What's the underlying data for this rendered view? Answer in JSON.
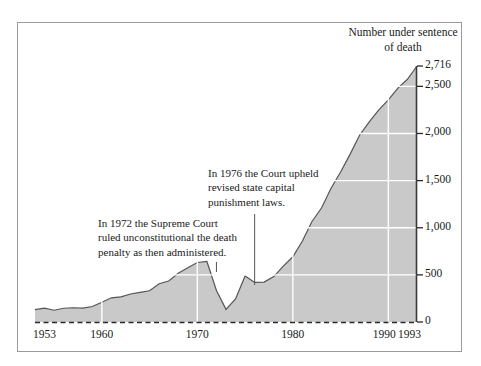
{
  "figure": {
    "title": "Number under sentence of death",
    "frame_color": "#9a9a9a",
    "fill_color": "#c9c9c9",
    "line_color": "#555555",
    "grid_color": "#ffffff",
    "background": "#ffffff"
  },
  "annotations": [
    {
      "id": "annotation-1972",
      "text": "In 1972 the Supreme Court ruled unconstitutional the death penalty as then administered.",
      "leader_year": 1972
    },
    {
      "id": "annotation-1976",
      "text": "In 1976 the Court upheld revised state capital punishment laws.",
      "leader_year": 1976
    }
  ],
  "axes": {
    "y_ticks": [
      "0",
      "500",
      "1,000",
      "1,500",
      "2,000",
      "2,500",
      "2,716"
    ],
    "y_tick_values": [
      0,
      500,
      1000,
      1500,
      2000,
      2500,
      2716
    ],
    "x_ticks": [
      "1953",
      "1960",
      "1970",
      "1980",
      "1990",
      "1993"
    ],
    "x_tick_values": [
      1953,
      1960,
      1970,
      1980,
      1990,
      1993
    ]
  },
  "chart_data": {
    "type": "area",
    "title": "Number under sentence of death",
    "xlabel": "",
    "ylabel": "Number under sentence of death",
    "xlim": [
      1953,
      1993
    ],
    "ylim": [
      0,
      2716
    ],
    "grid": true,
    "legend": "none",
    "x": [
      1953,
      1954,
      1955,
      1956,
      1957,
      1958,
      1959,
      1960,
      1961,
      1962,
      1963,
      1964,
      1965,
      1966,
      1967,
      1968,
      1969,
      1970,
      1971,
      1972,
      1973,
      1974,
      1975,
      1976,
      1977,
      1978,
      1979,
      1980,
      1981,
      1982,
      1983,
      1984,
      1985,
      1986,
      1987,
      1988,
      1989,
      1990,
      1991,
      1992,
      1993
    ],
    "values": [
      131,
      147,
      125,
      146,
      151,
      147,
      164,
      210,
      257,
      267,
      297,
      315,
      331,
      406,
      435,
      517,
      575,
      631,
      642,
      334,
      134,
      244,
      488,
      420,
      423,
      482,
      593,
      692,
      860,
      1066,
      1209,
      1420,
      1591,
      1781,
      1984,
      2124,
      2250,
      2356,
      2482,
      2575,
      2716
    ],
    "y_ticks": [
      0,
      500,
      1000,
      1500,
      2000,
      2500,
      2716
    ],
    "y_tick_labels": [
      "0",
      "500",
      "1,000",
      "1,500",
      "2,000",
      "2,500",
      "2,716"
    ],
    "x_ticks": [
      1953,
      1960,
      1970,
      1980,
      1990,
      1993
    ],
    "x_tick_labels": [
      "1953",
      "1960",
      "1970",
      "1980",
      "1990",
      "1993"
    ],
    "annotations": [
      "In 1972 the Supreme Court ruled unconstitutional the death penalty as then administered.",
      "In 1976 the Court upheld revised state capital punishment laws."
    ]
  }
}
